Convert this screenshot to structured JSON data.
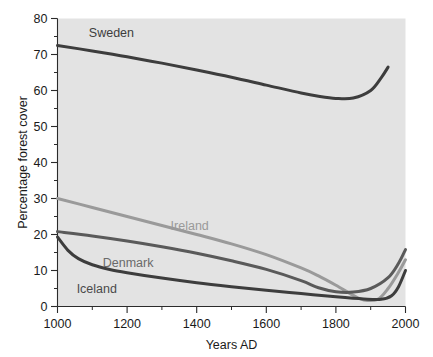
{
  "chart_data": {
    "type": "line",
    "title": "",
    "xlabel": "Years AD",
    "ylabel": "Percentage forest cover",
    "xlim": [
      1000,
      2000
    ],
    "ylim": [
      0,
      80
    ],
    "xticks": [
      1000,
      1200,
      1400,
      1600,
      1800,
      2000
    ],
    "xtick_labels": [
      "1000",
      "1200",
      "1400",
      "1600",
      "1800",
      "2000"
    ],
    "xticks_minor": [
      1100,
      1300,
      1500,
      1700,
      1900
    ],
    "yticks": [
      0,
      10,
      20,
      30,
      40,
      50,
      60,
      70,
      80
    ],
    "ytick_labels": [
      "0",
      "10",
      "20",
      "30",
      "40",
      "50",
      "60",
      "70",
      "80"
    ],
    "yticks_minor": [
      5,
      15,
      25,
      35,
      45,
      55,
      65,
      75
    ],
    "grid": false,
    "legend_position": "inline-labels",
    "plot_background": "#e3e3e3",
    "series": [
      {
        "name": "Sweden",
        "color": "#3d3d3d",
        "width": 3.0,
        "label_x": 1090,
        "label_y": 76,
        "label_color": "#3d3d3d",
        "x": [
          1000,
          1100,
          1200,
          1300,
          1400,
          1500,
          1600,
          1700,
          1750,
          1800,
          1850,
          1900,
          1930,
          1950
        ],
        "y": [
          72.5,
          71.0,
          69.4,
          67.6,
          65.7,
          63.7,
          61.5,
          59.3,
          58.4,
          57.8,
          57.9,
          60.0,
          63.5,
          66.5
        ]
      },
      {
        "name": "Ireland",
        "color": "#9a9a9a",
        "width": 3.0,
        "label_x": 1325,
        "label_y": 22.5,
        "label_color": "#9a9a9a",
        "x": [
          1000,
          1100,
          1200,
          1300,
          1400,
          1500,
          1600,
          1700,
          1750,
          1800,
          1850,
          1880,
          1920,
          1950,
          1980,
          2000
        ],
        "y": [
          30.0,
          27.5,
          25.0,
          22.5,
          20.0,
          17.4,
          14.4,
          10.7,
          8.5,
          5.9,
          3.1,
          1.8,
          2.0,
          5.0,
          9.5,
          13.0
        ]
      },
      {
        "name": "Denmark",
        "color": "#5a5a5a",
        "width": 3.0,
        "label_x": 1130,
        "label_y": 12.2,
        "label_color": "#6a6a6a",
        "x": [
          1000,
          1100,
          1200,
          1300,
          1400,
          1500,
          1600,
          1700,
          1750,
          1800,
          1850,
          1900,
          1950,
          1980,
          2000
        ],
        "y": [
          20.8,
          19.6,
          18.2,
          16.6,
          14.8,
          12.7,
          10.3,
          7.2,
          5.2,
          4.1,
          4.0,
          5.0,
          8.0,
          12.0,
          15.8
        ]
      },
      {
        "name": "Iceland",
        "color": "#3d3d3d",
        "width": 3.0,
        "label_x": 1055,
        "label_y": 5.0,
        "label_color": "#4a4a4a",
        "x": [
          1000,
          1030,
          1060,
          1100,
          1150,
          1200,
          1300,
          1400,
          1500,
          1600,
          1700,
          1800,
          1880,
          1930,
          1960,
          1980,
          2000
        ],
        "y": [
          19.3,
          15.6,
          13.3,
          11.6,
          10.3,
          9.4,
          7.9,
          6.6,
          5.5,
          4.5,
          3.6,
          2.7,
          2.1,
          2.0,
          3.0,
          5.5,
          10.0
        ]
      }
    ]
  }
}
